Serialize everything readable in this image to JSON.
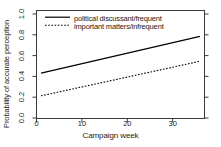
{
  "chart_data": {
    "type": "line",
    "title": "",
    "subtitle": "",
    "xlabel": "Campaign week",
    "ylabel": "Probability of accurate perception",
    "xlim": [
      0,
      37
    ],
    "ylim": [
      0.0,
      1.0
    ],
    "grid": false,
    "legend_position": "top-left inside plot area",
    "xticks": [
      "0",
      "10",
      "20",
      "30"
    ],
    "xtick_values": [
      0,
      10,
      20,
      30
    ],
    "yticks": [
      "0.0",
      "0.2",
      "0.4",
      "0.6",
      "0.8",
      "1.0"
    ],
    "ytick_values": [
      0.0,
      0.2,
      0.4,
      0.6,
      0.8,
      1.0
    ],
    "series": [
      {
        "name": "political discussant/frequent",
        "style": "solid",
        "color": "#000000",
        "x": [
          1,
          36
        ],
        "values": [
          0.42,
          0.76
        ]
      },
      {
        "name": "important matters/infrequent",
        "style": "dotted",
        "color": "#000000",
        "x": [
          1,
          36
        ],
        "values": [
          0.21,
          0.53
        ]
      }
    ]
  },
  "legend": {
    "entries": [
      {
        "label": "political discussant/frequent",
        "style": "solid"
      },
      {
        "label": "important matters/infrequent",
        "style": "dotted"
      }
    ]
  },
  "axes": {
    "x_title": "Campaign week",
    "y_title": "Probability of accurate perception",
    "x_tick_labels": [
      "0",
      "10",
      "20",
      "30"
    ],
    "y_tick_labels": [
      "0.0",
      "0.2",
      "0.4",
      "0.6",
      "0.8",
      "1.0"
    ]
  },
  "colors": {
    "background": "#ffffff",
    "foreground": "#1a1a1a",
    "line": "#000000"
  }
}
